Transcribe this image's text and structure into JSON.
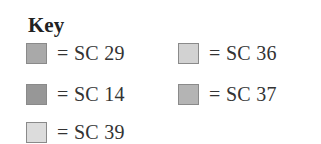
{
  "key": {
    "title": "Key",
    "entries": [
      {
        "label": "= SC 29",
        "color": "#a9a9a9"
      },
      {
        "label": "= SC 36",
        "color": "#d2d2d2"
      },
      {
        "label": "= SC 14",
        "color": "#979797"
      },
      {
        "label": "= SC 37",
        "color": "#b4b4b4"
      },
      {
        "label": "= SC 39",
        "color": "#dcdcdc"
      }
    ]
  }
}
